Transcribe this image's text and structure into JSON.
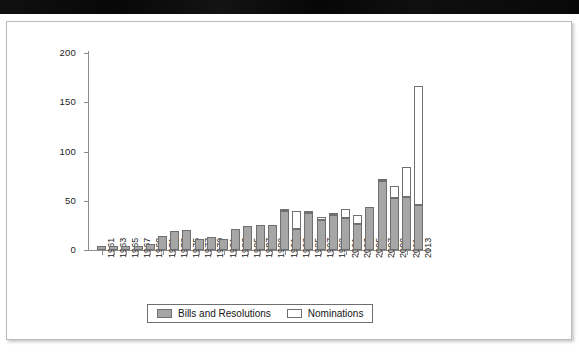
{
  "page": {
    "background_color": "#ffffff",
    "topbar_color": "#0a0a0a",
    "card_border_color": "#b9b9b9"
  },
  "legend": {
    "position": "bottom-center",
    "items": [
      {
        "label": "Bills and Resolutions",
        "swatch": "gray-filled-swatch",
        "color": "#a6a6a6"
      },
      {
        "label": "Nominations",
        "swatch": "white-open-swatch",
        "color": "#ffffff"
      }
    ]
  },
  "chart_data": {
    "type": "bar",
    "stacked": true,
    "title": "",
    "subtitle": "",
    "xlabel": "",
    "ylabel": "",
    "ylim": [
      0,
      200
    ],
    "yticks": [
      0,
      50,
      100,
      150,
      200
    ],
    "grid": false,
    "legend_position": "bottom-center",
    "categories": [
      "1961",
      "1963",
      "1965",
      "1967",
      "1969",
      "1971",
      "1973",
      "1975",
      "1977",
      "1979",
      "1981",
      "1983",
      "1985",
      "1987",
      "1989",
      "1991",
      "1993",
      "1995",
      "1997",
      "1999",
      "2001",
      "2003",
      "2005",
      "2007",
      "2009",
      "2011",
      "2013"
    ],
    "series": [
      {
        "name": "Bills and Resolutions",
        "color": "#a6a6a6",
        "values": [
          4,
          4,
          4,
          4,
          6,
          14,
          19,
          20,
          11,
          13,
          11,
          21,
          24,
          25,
          25,
          40,
          21,
          38,
          30,
          36,
          32,
          26,
          44,
          70,
          53,
          54,
          46
        ]
      },
      {
        "name": "Nominations",
        "color": "#ffffff",
        "values": [
          0,
          0,
          0,
          0,
          0,
          0,
          0,
          0,
          0,
          0,
          0,
          0,
          0,
          0,
          0,
          1,
          19,
          1,
          4,
          1,
          10,
          10,
          0,
          1,
          12,
          30,
          121
        ]
      }
    ],
    "totals": [
      4,
      4,
      4,
      4,
      6,
      14,
      19,
      20,
      11,
      13,
      11,
      21,
      24,
      25,
      25,
      41,
      40,
      39,
      34,
      37,
      42,
      36,
      44,
      71,
      65,
      84,
      167
    ]
  }
}
